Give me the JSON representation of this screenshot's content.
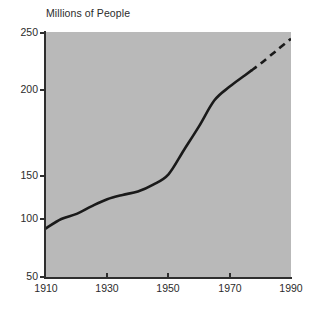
{
  "chart_data": {
    "type": "line",
    "title": "Millions of People",
    "xlabel": "",
    "ylabel": "",
    "xlim": [
      1910,
      1990
    ],
    "ylim": [
      50,
      250
    ],
    "grid": false,
    "legend": null,
    "background_color": "#b9b9b9",
    "line_color": "#1a1a1a",
    "x_ticks": [
      "1910",
      "1930",
      "1950",
      "1970",
      "1990"
    ],
    "y_ticks": [
      "250",
      "200",
      "150",
      "100",
      "50"
    ],
    "series": [
      {
        "name": "Population (actual)",
        "style": "solid",
        "x": [
          1910,
          1915,
          1920,
          1925,
          1930,
          1935,
          1940,
          1945,
          1950,
          1955,
          1960,
          1965,
          1970,
          1975,
          1977
        ],
        "values": [
          92,
          100,
          106,
          115,
          123,
          128,
          132,
          140,
          151,
          165,
          179,
          194,
          203,
          213,
          217
        ]
      },
      {
        "name": "Population (projected)",
        "style": "dashed",
        "x": [
          1977,
          1980,
          1985,
          1990
        ],
        "values": [
          217,
          223,
          234,
          245
        ]
      }
    ]
  },
  "axis": {
    "y_tick_positions": [
      33,
      90,
      176,
      219,
      277
    ],
    "x_tick_positions": [
      46,
      107,
      168,
      230,
      291
    ]
  }
}
